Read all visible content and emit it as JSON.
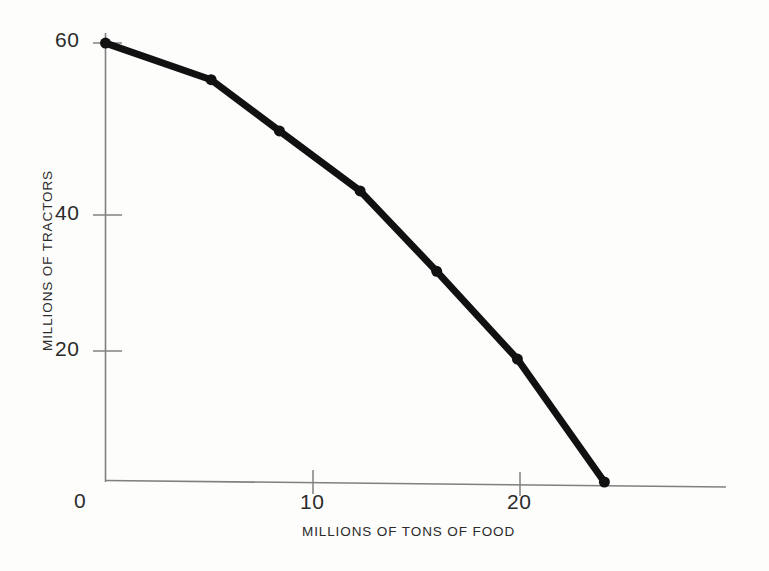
{
  "chart_data": {
    "type": "line",
    "title": "",
    "subtitle": "",
    "xlabel": "MILLIONS OF TONS OF FOOD",
    "ylabel": "MILLIONS OF TRACTORS",
    "xlim": [
      0,
      30
    ],
    "ylim": [
      0,
      66
    ],
    "grid": false,
    "legend": null,
    "legend_position": "none",
    "xticks": [
      0,
      10,
      20
    ],
    "xtick_labels": [
      "0",
      "10",
      "20"
    ],
    "yticks": [
      0,
      20,
      40,
      60
    ],
    "ytick_labels": [
      "0",
      "20",
      "40",
      "60"
    ],
    "marker": "filled-circle",
    "line_color": "#111111",
    "line_width_px": 7,
    "marker_color": "#111111",
    "marker_size_px": 11,
    "axis_color": "#7a7a7a",
    "background_color": "#fdfdfc",
    "annotations": [],
    "series": [
      {
        "name": "production possibility frontier",
        "x": [
          0.0,
          5.1,
          8.4,
          12.3,
          16.0,
          19.9,
          24.1
        ],
        "y": [
          60.0,
          55.0,
          48.0,
          39.8,
          28.8,
          16.8,
          0.0
        ]
      }
    ]
  },
  "axis_titles": {
    "x": "MILLIONS OF TONS OF FOOD",
    "y": "MILLIONS OF TRACTORS"
  },
  "tick_text": {
    "y60": "60",
    "y40": "40",
    "y20": "20",
    "y0": "0",
    "x10": "10",
    "x20": "20"
  }
}
